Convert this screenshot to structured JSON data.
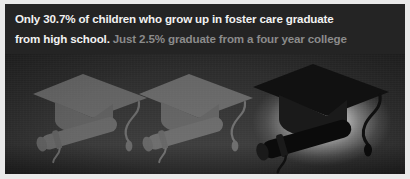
{
  "infographic": {
    "headline": {
      "line1_strong": "Only 30.7% of children who grow up in foster care graduate",
      "line2_strong": "from high school.",
      "line2_muted": "Just 2.5% graduate from a four year college"
    },
    "colors": {
      "background": "#242424",
      "text_primary": "#f2f2f2",
      "text_muted": "#8b8b8b",
      "glow": "#ffffff",
      "cap_solid": "#111111",
      "cap_faded": "#a9a9a9",
      "frame": "#e9e9e9"
    },
    "photo": {
      "alt_description": "Three graduation caps with rolled diplomas; two are faded into the dark background and one at right is solid black lit by a bright glow",
      "items": [
        {
          "name": "faded-cap-1",
          "state": "faded",
          "order": 1
        },
        {
          "name": "faded-cap-2",
          "state": "faded",
          "order": 2
        },
        {
          "name": "solid-cap",
          "state": "highlighted",
          "order": 3
        }
      ]
    },
    "stats": {
      "high_school_graduation_rate": "30.7%",
      "four_year_college_graduation_rate": "2.5%"
    }
  }
}
